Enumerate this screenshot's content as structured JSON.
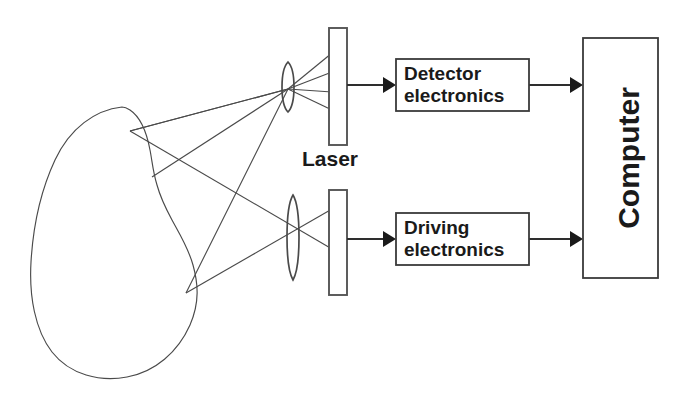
{
  "figure": {
    "background_color": "#ffffff",
    "line_color": "#4a4a4a",
    "text_color": "#1a1a1a"
  },
  "labels": {
    "laser": "Laser",
    "detector_electronics_line1": "Detector",
    "detector_electronics_line2": "electronics",
    "driving_electronics_line1": "Driving",
    "driving_electronics_line2": "electronics",
    "computer": "Computer"
  },
  "components": {
    "sample": {
      "name": "sample-blob",
      "shape": "irregular-closed-contour"
    },
    "lenses": [
      {
        "name": "upper-lens",
        "cx": 288,
        "cy": 87,
        "rx": 7,
        "ry": 25
      },
      {
        "name": "lower-lens",
        "cx": 293,
        "cy": 237,
        "rx": 7,
        "ry": 43
      }
    ],
    "bars": [
      {
        "name": "upper-laser-bar",
        "x": 329,
        "y": 28,
        "width": 18,
        "height": 117
      },
      {
        "name": "lower-laser-bar",
        "x": 329,
        "y": 190,
        "width": 18,
        "height": 105
      }
    ],
    "boxes": [
      {
        "name": "detector-electronics-box",
        "x": 396,
        "y": 59,
        "width": 133,
        "height": 52
      },
      {
        "name": "driving-electronics-box",
        "x": 396,
        "y": 213,
        "width": 133,
        "height": 52
      },
      {
        "name": "computer-box",
        "x": 583,
        "y": 38,
        "width": 75,
        "height": 240
      }
    ],
    "connections": [
      {
        "name": "upper-bar-to-detector",
        "from": "upper-laser-bar",
        "to": "detector-electronics-box",
        "y": 85
      },
      {
        "name": "detector-to-computer",
        "from": "detector-electronics-box",
        "to": "computer-box",
        "y": 85
      },
      {
        "name": "lower-bar-to-driving",
        "from": "lower-laser-bar",
        "to": "driving-electronics-box",
        "y": 239
      },
      {
        "name": "driving-to-computer",
        "from": "driving-electronics-box",
        "to": "computer-box",
        "y": 239
      }
    ],
    "ray_bundles": [
      {
        "name": "upper-ray-fan",
        "converges_at": [
          288,
          89
        ],
        "ray_count": 4
      },
      {
        "name": "lower-ray-fan",
        "converges_at": [
          293,
          237
        ],
        "ray_count": 2
      }
    ]
  }
}
